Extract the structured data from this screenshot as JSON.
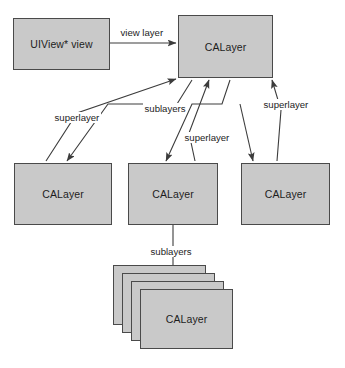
{
  "diagram": {
    "type": "node-edge-diagram",
    "background_color": "#ffffff",
    "node_fill_color": "#c9c9c9",
    "node_border_color": "#4a4a4a",
    "edge_color": "#3c3c3c",
    "text_color": "#1d1d1d",
    "nodes": [
      {
        "id": "uiview",
        "label": "UIView* view",
        "x": 13,
        "y": 18,
        "w": 97,
        "h": 52,
        "row": "top"
      },
      {
        "id": "root-calayer",
        "label": "CALayer",
        "x": 178,
        "y": 15,
        "w": 95,
        "h": 63,
        "row": "top"
      },
      {
        "id": "calayer-left",
        "label": "CALayer",
        "x": 14,
        "y": 163,
        "w": 98,
        "h": 62,
        "row": "middle"
      },
      {
        "id": "calayer-center",
        "label": "CALayer",
        "x": 128,
        "y": 163,
        "w": 90,
        "h": 62,
        "row": "middle"
      },
      {
        "id": "calayer-right",
        "label": "CALayer",
        "x": 241,
        "y": 163,
        "w": 89,
        "h": 62,
        "row": "middle"
      },
      {
        "id": "calayer-stack-4",
        "label": "CALayer",
        "x": 113,
        "y": 265,
        "w": 93,
        "h": 60,
        "row": "stack"
      },
      {
        "id": "calayer-stack-3",
        "label": "CALayer",
        "x": 122,
        "y": 273,
        "w": 93,
        "h": 60,
        "row": "stack"
      },
      {
        "id": "calayer-stack-2",
        "label": "CALayer",
        "x": 131,
        "y": 281,
        "w": 93,
        "h": 60,
        "row": "stack"
      },
      {
        "id": "calayer-stack-1",
        "label": "CALayer",
        "x": 140,
        "y": 289,
        "w": 93,
        "h": 60,
        "row": "stack"
      }
    ],
    "edges": [
      {
        "id": "edge-view-layer",
        "label": "view layer",
        "from": "uiview",
        "to": "root-calayer",
        "label_x": 119,
        "label_y": 27
      },
      {
        "id": "edge-superlayer-left",
        "label": "superlayer",
        "from": "calayer-left",
        "to": "root-calayer",
        "label_x": 53,
        "label_y": 112
      },
      {
        "id": "edge-sublayers-top",
        "label": "sublayers",
        "from": "root-calayer",
        "to": "calayer-left",
        "label_x": 143,
        "label_y": 103
      },
      {
        "id": "edge-superlayer-center",
        "label": "superlayer",
        "from": "calayer-center",
        "to": "root-calayer",
        "label_x": 183,
        "label_y": 132
      },
      {
        "id": "edge-superlayer-right",
        "label": "superlayer",
        "from": "calayer-right",
        "to": "root-calayer",
        "label_x": 262,
        "label_y": 99
      },
      {
        "id": "edge-sublayers-bottom",
        "label": "sublayers",
        "from": "calayer-center",
        "to": "calayer-stack-1",
        "label_x": 149,
        "label_y": 246
      }
    ]
  }
}
